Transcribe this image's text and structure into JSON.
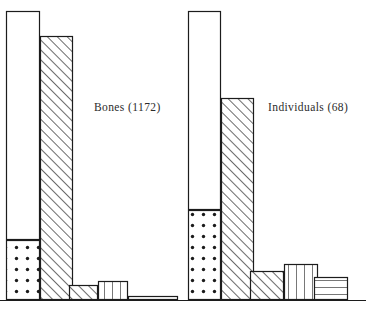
{
  "figure": {
    "background_color": "#ffffff",
    "ink_color": "#1c1c1c",
    "baseline_y": 300,
    "width": 366,
    "height": 312
  },
  "labels": {
    "bones": "Bones (1172)",
    "individuals": "Individuals (68)"
  },
  "chart_data": {
    "type": "bar",
    "title": "",
    "subtitle": "",
    "xlabel": "",
    "ylabel": "",
    "grid": false,
    "legend_position": "none",
    "axis_ranges": {
      "y_min": 0,
      "y_max": 100,
      "y_unit": "percent"
    },
    "groups": [
      {
        "name": "Bones",
        "label": "Bones (1172)",
        "total": 1172,
        "categories": [
          "bar-1",
          "bar-2",
          "bar-3",
          "bar-4",
          "bar-5",
          "bar-6"
        ],
        "bars": [
          {
            "index": 1,
            "fill": "open",
            "x": 6,
            "y": 11,
            "w": 34,
            "h": 289,
            "segments": [
              {
                "fill": "open",
                "x": 6,
                "y": 11,
                "w": 34,
                "h": 229
              },
              {
                "fill": "dotted",
                "x": 6,
                "y": 240,
                "w": 34,
                "h": 60
              }
            ]
          },
          {
            "index": 2,
            "fill": "diagonal-hatch",
            "x": 40,
            "y": 36,
            "w": 33,
            "h": 264,
            "segments": [
              {
                "fill": "diagonal-hatch",
                "x": 40,
                "y": 36,
                "w": 33,
                "h": 264
              }
            ]
          },
          {
            "index": 3,
            "fill": "diagonal-hatch",
            "x": 69,
            "y": 285,
            "w": 29,
            "h": 15,
            "segments": [
              {
                "fill": "diagonal-hatch",
                "x": 69,
                "y": 285,
                "w": 29,
                "h": 15
              }
            ]
          },
          {
            "index": 4,
            "fill": "vertical-stripe",
            "x": 98,
            "y": 281,
            "w": 30,
            "h": 19,
            "segments": [
              {
                "fill": "vertical-stripe",
                "x": 98,
                "y": 281,
                "w": 30,
                "h": 19
              }
            ]
          },
          {
            "index": 5,
            "fill": "horizontal-stripe",
            "x": 128,
            "y": 296,
            "w": 50,
            "h": 4,
            "segments": [
              {
                "fill": "horizontal-stripe",
                "x": 128,
                "y": 296,
                "w": 50,
                "h": 4
              }
            ]
          }
        ]
      },
      {
        "name": "Individuals",
        "label": "Individuals (68)",
        "total": 68,
        "categories": [
          "bar-1",
          "bar-2",
          "bar-3",
          "bar-4",
          "bar-5"
        ],
        "bars": [
          {
            "index": 1,
            "fill": "open",
            "x": 188,
            "y": 11,
            "w": 33,
            "h": 289,
            "segments": [
              {
                "fill": "open",
                "x": 188,
                "y": 11,
                "w": 33,
                "h": 199
              },
              {
                "fill": "dotted",
                "x": 188,
                "y": 210,
                "w": 33,
                "h": 90
              }
            ]
          },
          {
            "index": 2,
            "fill": "diagonal-hatch",
            "x": 221,
            "y": 98,
            "w": 33,
            "h": 202,
            "segments": [
              {
                "fill": "diagonal-hatch",
                "x": 221,
                "y": 98,
                "w": 33,
                "h": 202
              }
            ]
          },
          {
            "index": 3,
            "fill": "diagonal-hatch",
            "x": 250,
            "y": 271,
            "w": 34,
            "h": 29,
            "segments": [
              {
                "fill": "diagonal-hatch",
                "x": 250,
                "y": 271,
                "w": 34,
                "h": 29
              }
            ]
          },
          {
            "index": 4,
            "fill": "vertical-stripe",
            "x": 284,
            "y": 264,
            "w": 34,
            "h": 36,
            "segments": [
              {
                "fill": "vertical-stripe",
                "x": 284,
                "y": 264,
                "w": 34,
                "h": 36
              }
            ]
          },
          {
            "index": 5,
            "fill": "horizontal-stripe",
            "x": 314,
            "y": 277,
            "w": 34,
            "h": 23,
            "segments": [
              {
                "fill": "horizontal-stripe",
                "x": 314,
                "y": 277,
                "w": 34,
                "h": 23
              }
            ]
          }
        ]
      }
    ]
  }
}
